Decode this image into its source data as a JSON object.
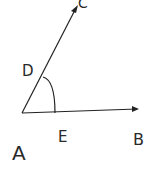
{
  "diagram": {
    "type": "angle",
    "points": {
      "A": {
        "label": "A",
        "x": 22,
        "y": 113
      },
      "B": {
        "label": "B",
        "x": 137,
        "y": 109
      },
      "C": {
        "label": "C",
        "x": 76,
        "y": 8
      },
      "D": {
        "label": "D",
        "x": 44,
        "y": 77
      },
      "E": {
        "label": "E",
        "x": 55,
        "y": 113
      }
    },
    "labels": {
      "A": "A",
      "B": "B",
      "C": "C",
      "D": "D",
      "E": "E"
    },
    "colors": {
      "stroke": "#222222",
      "background": "#ffffff"
    }
  }
}
